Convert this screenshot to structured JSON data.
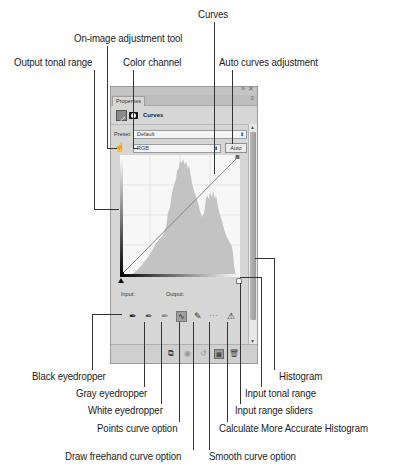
{
  "panel": {
    "window_controls": [
      "»",
      "✕"
    ],
    "tab_label": "Properties",
    "tab_menu": "≡",
    "adjustment_title": "Curves",
    "preset_label": "Preset:",
    "preset_value": "Default",
    "channel_value": "RGB",
    "auto_button": "Auto",
    "input_label": "Input:",
    "output_label": "Output:",
    "tools": [
      {
        "name": "black-eyedropper",
        "glyph": "✒"
      },
      {
        "name": "gray-eyedropper",
        "glyph": "✒"
      },
      {
        "name": "white-eyedropper",
        "glyph": "✒"
      },
      {
        "name": "points-curve",
        "glyph": "∿"
      },
      {
        "name": "freehand-curve",
        "glyph": "✎"
      },
      {
        "name": "smooth-curve",
        "glyph": "⋯"
      },
      {
        "name": "calculate-histogram",
        "glyph": "⚠"
      }
    ],
    "bottom_icons": [
      {
        "name": "clip-to-layer",
        "glyph": "⧉"
      },
      {
        "name": "view-previous",
        "glyph": "◉"
      },
      {
        "name": "reset",
        "glyph": "↺"
      },
      {
        "name": "toggle-visibility",
        "glyph": "◙"
      },
      {
        "name": "delete",
        "glyph": "🗑"
      }
    ]
  },
  "callouts": {
    "curves": "Curves",
    "on_image_tool": "On-image adjustment tool",
    "output_tonal_range": "Output tonal range",
    "color_channel": "Color channel",
    "auto_curves": "Auto curves adjustment",
    "histogram": "Histogram",
    "input_tonal_range": "Input tonal range",
    "input_range_sliders": "Input range sliders",
    "calc_histogram": "Calculate More Accurate Histogram",
    "smooth_curve": "Smooth curve option",
    "black_eyedropper": "Black eyedropper",
    "gray_eyedropper": "Gray eyedropper",
    "white_eyedropper": "White eyedropper",
    "points_curve": "Points curve option",
    "freehand_curve": "Draw freehand curve option"
  },
  "colors": {
    "panel_bg": "#d6d6d6",
    "histogram_fill": "#c3c3c3",
    "graph_bg": "#f7f7f7"
  }
}
